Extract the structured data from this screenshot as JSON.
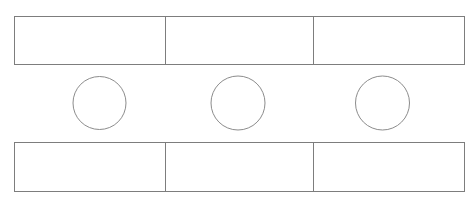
{
  "canvas": {
    "width": 475,
    "height": 204,
    "background_color": "#ffffff"
  },
  "style": {
    "stroke_color": "#8a8a8a",
    "bar_stroke_color": "#7d7d7d",
    "circle_stroke_color": "#8c8c8c",
    "fill_color": "#ffffff",
    "stroke_width": 1
  },
  "diagram": {
    "type": "line-drawing",
    "title": "",
    "shape_count": 9,
    "bars": [
      {
        "name": "top-bar",
        "x": 14,
        "y": 16,
        "width": 450,
        "height": 48,
        "label": "",
        "cells": [
          {
            "name": "top-bar-cell-1",
            "x": 14,
            "width": 151,
            "label": ""
          },
          {
            "name": "top-bar-cell-2",
            "x": 165,
            "width": 148,
            "label": ""
          },
          {
            "name": "top-bar-cell-3",
            "x": 313,
            "width": 151,
            "label": ""
          }
        ],
        "dividers": [
          165,
          313
        ]
      },
      {
        "name": "bottom-bar",
        "x": 14,
        "y": 142,
        "width": 450,
        "height": 49,
        "label": "",
        "cells": [
          {
            "name": "bottom-bar-cell-1",
            "x": 14,
            "width": 151,
            "label": ""
          },
          {
            "name": "bottom-bar-cell-2",
            "x": 165,
            "width": 148,
            "label": ""
          },
          {
            "name": "bottom-bar-cell-3",
            "x": 313,
            "width": 151,
            "label": ""
          }
        ],
        "dividers": [
          165,
          313
        ]
      }
    ],
    "circles": [
      {
        "name": "circle-1",
        "cx": 99.5,
        "cy": 103,
        "r": 26.5,
        "label": ""
      },
      {
        "name": "circle-2",
        "cx": 238.0,
        "cy": 103,
        "r": 27.0,
        "label": ""
      },
      {
        "name": "circle-3",
        "cx": 382.5,
        "cy": 103,
        "r": 27.0,
        "label": ""
      }
    ]
  }
}
